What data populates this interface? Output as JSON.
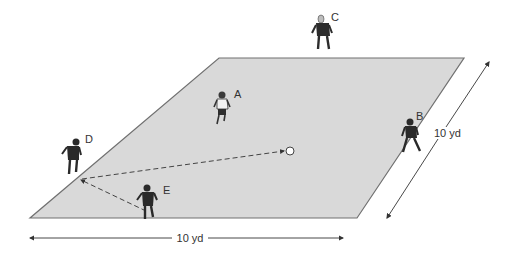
{
  "diagram": {
    "type": "soccer drill field diagram",
    "field": {
      "fill": "#d9d9d9",
      "stroke": "#666666",
      "corners": [
        [
          219,
          58
        ],
        [
          464,
          58
        ],
        [
          357,
          218
        ],
        [
          30,
          218
        ]
      ]
    },
    "players": [
      {
        "id": "A",
        "label": "A",
        "x": 222,
        "y": 110,
        "jersey": "light",
        "label_x": 234,
        "label_y": 98
      },
      {
        "id": "B",
        "label": "B",
        "x": 411,
        "y": 138,
        "jersey": "dark",
        "label_x": 416,
        "label_y": 120
      },
      {
        "id": "C",
        "label": "C",
        "x": 323,
        "y": 35,
        "jersey": "dark-light-head",
        "label_x": 331,
        "label_y": 21
      },
      {
        "id": "D",
        "label": "D",
        "x": 73,
        "y": 158,
        "jersey": "dark",
        "label_x": 85,
        "label_y": 143
      },
      {
        "id": "E",
        "label": "E",
        "x": 148,
        "y": 203,
        "jersey": "dark",
        "label_x": 163,
        "label_y": 194
      }
    ],
    "ball": {
      "x": 290,
      "y": 151,
      "r": 4
    },
    "passes": [
      {
        "from": [
          146,
          211
        ],
        "to": [
          80,
          179
        ],
        "style": "dashed"
      },
      {
        "from": [
          80,
          179
        ],
        "to": [
          285,
          151
        ],
        "style": "dashed"
      }
    ],
    "dimensions": {
      "bottom": {
        "label": "10 yd",
        "from": [
          27,
          238
        ],
        "to": [
          345,
          238
        ],
        "label_x": 190,
        "label_y": 242
      },
      "right": {
        "label": "10 yd",
        "from": [
          490,
          60
        ],
        "to": [
          385,
          220
        ],
        "label_x": 434,
        "label_y": 134
      }
    }
  }
}
